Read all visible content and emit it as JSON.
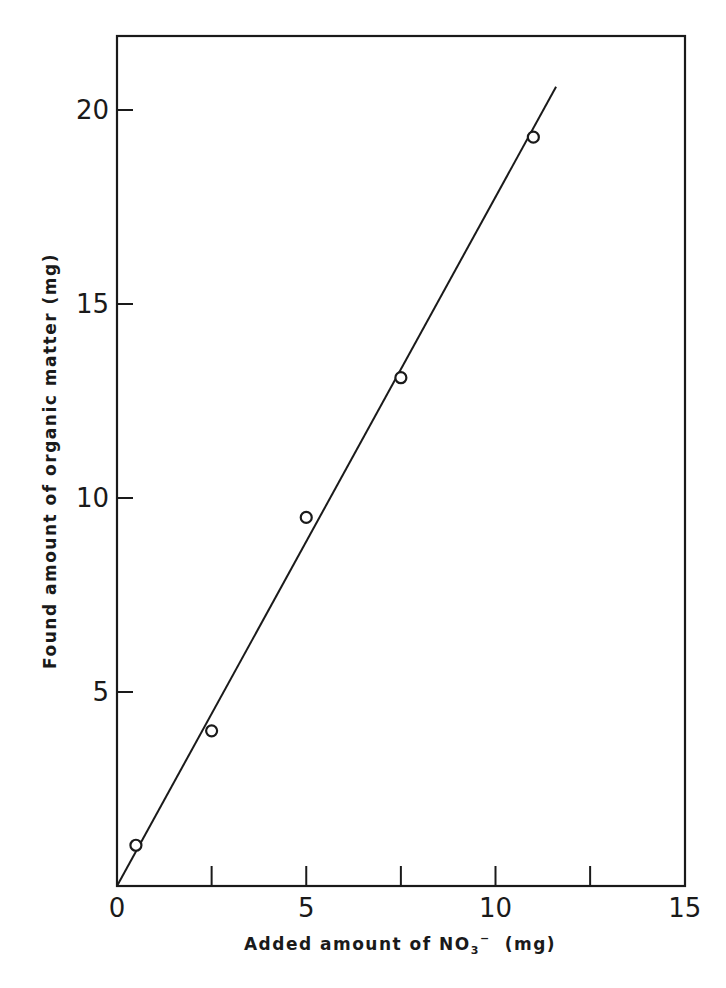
{
  "chart_data": {
    "type": "scatter",
    "title": "",
    "xlabel": "Added amount of NO₃⁻ (mg)",
    "xlabel_parts": {
      "main": "Added amount of NO",
      "sub": "3",
      "sup": "−",
      "unit": "(mg)"
    },
    "ylabel": "Found amount of organic matter (mg)",
    "xlim": [
      0,
      15
    ],
    "ylim": [
      0,
      21.5
    ],
    "x_ticks": [
      0,
      2.5,
      5,
      7.5,
      10,
      12.5,
      15
    ],
    "x_tick_labels": [
      {
        "value": 0,
        "label": "0"
      },
      {
        "value": 5,
        "label": "5"
      },
      {
        "value": 10,
        "label": "10"
      },
      {
        "value": 15,
        "label": "15"
      }
    ],
    "y_ticks": [
      5,
      10,
      15,
      20
    ],
    "y_tick_labels": [
      {
        "value": 5,
        "label": "5"
      },
      {
        "value": 10,
        "label": "10"
      },
      {
        "value": 15,
        "label": "15"
      },
      {
        "value": 20,
        "label": "20"
      }
    ],
    "grid": false,
    "legend": null,
    "series": [
      {
        "name": "measured",
        "marker": "open-circle",
        "x": [
          0.5,
          2.5,
          5.0,
          7.5,
          11.0
        ],
        "y": [
          1.05,
          4.0,
          9.5,
          13.1,
          19.3
        ]
      },
      {
        "name": "fit-line",
        "marker": "none",
        "x": [
          0,
          11.6
        ],
        "y": [
          0,
          20.6
        ]
      }
    ]
  },
  "layout": {
    "plot": {
      "left": 117,
      "top": 36,
      "right": 685,
      "bottom": 886
    },
    "px_per_x": 37.85,
    "px_per_y": 38.8
  }
}
